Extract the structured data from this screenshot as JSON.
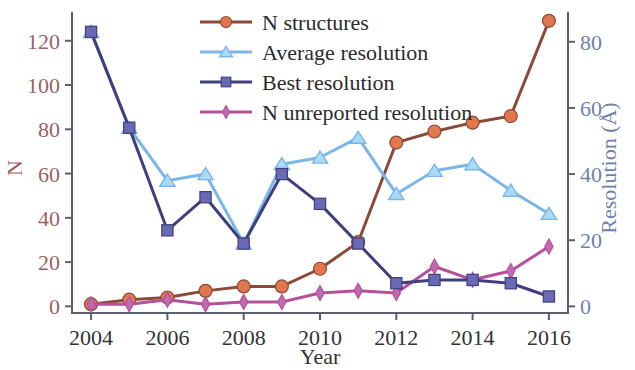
{
  "chart_data": {
    "type": "line",
    "title": "",
    "xlabel": "Year",
    "ylabel": "N",
    "y2label": "Resolution (Å)",
    "grid": false,
    "legend_position": "upper center",
    "x": [
      2004,
      2005,
      2006,
      2007,
      2008,
      2009,
      2010,
      2011,
      2012,
      2013,
      2014,
      2015,
      2016
    ],
    "xtick_labels": [
      "2004",
      "2006",
      "2008",
      "2010",
      "2012",
      "2014",
      "2016"
    ],
    "xtick_values": [
      2004,
      2006,
      2008,
      2010,
      2012,
      2014,
      2016
    ],
    "xlim": [
      2003.5,
      2016.5
    ],
    "ylim": [
      -3,
      133
    ],
    "ytick_labels": [
      "0",
      "20",
      "40",
      "60",
      "80",
      "100",
      "120"
    ],
    "ytick_values": [
      0,
      20,
      40,
      60,
      80,
      100,
      120
    ],
    "y2lim": [
      -2,
      89
    ],
    "y2tick_labels": [
      "0",
      "20",
      "40",
      "60",
      "80"
    ],
    "y2tick_values": [
      0,
      20,
      40,
      60,
      80
    ],
    "series": [
      {
        "name": "N structures",
        "axis": "left",
        "marker": "circle",
        "line_color": "#8a4a38",
        "marker_color": "#e2764d",
        "values": [
          1,
          3,
          4,
          7,
          9,
          9,
          17,
          29,
          74,
          79,
          83,
          86,
          129
        ]
      },
      {
        "name": "Average resolution",
        "axis": "right",
        "marker": "triangle",
        "line_color": "#7cb6e8",
        "marker_color": "#a8dcf5",
        "values": [
          83,
          54,
          38,
          40,
          19,
          43,
          45,
          51,
          34,
          41,
          43,
          35,
          28
        ]
      },
      {
        "name": "Best resolution",
        "axis": "right",
        "marker": "square",
        "line_color": "#3f3f7d",
        "marker_color": "#6a6ab4",
        "values": [
          83,
          54,
          23,
          33,
          19,
          40,
          31,
          19,
          7,
          8,
          8,
          7,
          3
        ]
      },
      {
        "name": "N unreported resolution",
        "axis": "left",
        "marker": "diamond",
        "line_color": "#b5509b",
        "marker_color": "#c06bb0",
        "values": [
          1,
          1,
          3,
          1,
          2,
          2,
          6,
          7,
          6,
          18,
          12,
          16,
          27
        ]
      }
    ]
  },
  "legend": {
    "items": [
      {
        "label": "N structures"
      },
      {
        "label": "Average resolution"
      },
      {
        "label": "Best resolution"
      },
      {
        "label": "N unreported resolution"
      }
    ]
  },
  "axes": {
    "left_title": "N",
    "right_title": "Resolution (Å)",
    "x_title": "Year"
  },
  "colors": {
    "n_structures_line": "#8a4a38",
    "n_structures_marker": "#e2764d",
    "average_resolution_line": "#7cb6e8",
    "average_resolution_marker": "#a8dcf5",
    "best_resolution_line": "#3f3f7d",
    "best_resolution_marker": "#6a6ab4",
    "n_unreported_line": "#b5509b",
    "n_unreported_marker": "#c06bb0",
    "left_axis_text": "#9e5f5f",
    "right_axis_text": "#6f7fae",
    "x_axis_text": "#333333"
  }
}
